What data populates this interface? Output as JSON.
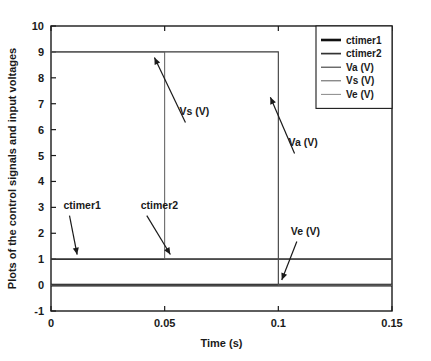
{
  "chart_data": {
    "type": "line",
    "title": "",
    "xlabel": "Time (s)",
    "ylabel": "Plots of the control signals and input voltages",
    "xlim": [
      0,
      0.15
    ],
    "ylim": [
      -1,
      10
    ],
    "grid": false,
    "xticks": [
      "0",
      "0.05",
      "0.1",
      "0.15"
    ],
    "xtick_values": [
      0,
      0.05,
      0.1,
      0.15
    ],
    "yticks": [
      "-1",
      "0",
      "1",
      "2",
      "3",
      "4",
      "5",
      "6",
      "7",
      "8",
      "9",
      "10"
    ],
    "ytick_values": [
      -1,
      0,
      1,
      2,
      3,
      4,
      5,
      6,
      7,
      8,
      9,
      10
    ],
    "legend_position": "top-right",
    "series": [
      {
        "name": "ctimer1",
        "label": "ctimer1",
        "color": "#111111",
        "width": 2.6,
        "x": [
          0,
          0.15
        ],
        "values": [
          0,
          0
        ]
      },
      {
        "name": "ctimer2",
        "label": "ctimer2",
        "color": "#333333",
        "width": 1.7,
        "x": [
          0,
          0.15
        ],
        "values": [
          1,
          1
        ]
      },
      {
        "name": "Va (V)",
        "label": "Va (V)",
        "color": "#3a3a3a",
        "width": 1.1,
        "x": [
          0,
          0.1,
          0.1,
          0.15
        ],
        "values": [
          9,
          9,
          0,
          0
        ]
      },
      {
        "name": "Vs (V)",
        "label": "Vs (V)",
        "color": "#5a5a5a",
        "width": 1.0,
        "x": [
          0,
          0.05,
          0.05,
          0.15
        ],
        "values": [
          9,
          9,
          1,
          1
        ]
      },
      {
        "name": "Ve (V)",
        "label": "Ve (V)",
        "color": "#7a7a7a",
        "width": 0.9,
        "x": [
          0,
          0.15
        ],
        "values": [
          0,
          0
        ]
      }
    ],
    "annotations": [
      {
        "text": "Vs (V)",
        "text_x": 0.0565,
        "text_y": 6.55,
        "tip_x": 0.0455,
        "tip_y": 8.78
      },
      {
        "text": "Va (V)",
        "text_x": 0.1045,
        "text_y": 5.35,
        "tip_x": 0.0965,
        "tip_y": 7.25
      },
      {
        "text": "ctimer1",
        "text_x": 0.0055,
        "text_y": 2.95,
        "tip_x": 0.0115,
        "tip_y": 1.18
      },
      {
        "text": "ctimer2",
        "text_x": 0.0395,
        "text_y": 2.95,
        "tip_x": 0.0525,
        "tip_y": 1.18
      },
      {
        "text": "Ve (V)",
        "text_x": 0.1055,
        "text_y": 1.95,
        "tip_x": 0.1015,
        "tip_y": 0.2
      }
    ]
  }
}
